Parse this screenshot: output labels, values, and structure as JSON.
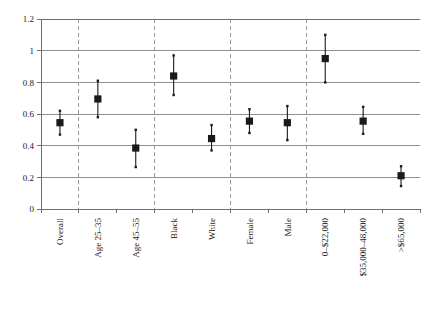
{
  "chart_data": {
    "type": "scatter",
    "title": "",
    "subtitle": "",
    "xlabel": "",
    "ylabel": "",
    "ylim": [
      0,
      1.2
    ],
    "grid": true,
    "legend": "none",
    "y_ticks": [
      "0",
      "0.2",
      "0.4",
      "0.6",
      "0.8",
      "1",
      "1.2"
    ],
    "y_tick_values": [
      0,
      0.2,
      0.4,
      0.6,
      0.8,
      1.0,
      1.2
    ],
    "categories": [
      "Overall",
      "Age 25–35",
      "Age 45–55",
      "Black",
      "White",
      "Female",
      "Male",
      "0–$22,000",
      "$35,000–48,000",
      ">$65,000"
    ],
    "values": [
      0.545,
      0.695,
      0.385,
      0.84,
      0.445,
      0.555,
      0.545,
      0.95,
      0.555,
      0.21
    ],
    "upper": [
      0.62,
      0.81,
      0.5,
      0.97,
      0.53,
      0.63,
      0.65,
      1.1,
      0.645,
      0.27
    ],
    "lower": [
      0.47,
      0.58,
      0.265,
      0.72,
      0.37,
      0.48,
      0.435,
      0.8,
      0.475,
      0.145
    ],
    "group_separators_after": [
      "Overall",
      "Age 45–55",
      "White",
      "Male"
    ],
    "colors": {
      "marker": "#1a1a1a",
      "whisker": "#1a1a1a",
      "grid": "#8f8f8f",
      "axis": "#6f6f6f",
      "separator": "#9a9a9a",
      "background": "#ffffff"
    }
  }
}
